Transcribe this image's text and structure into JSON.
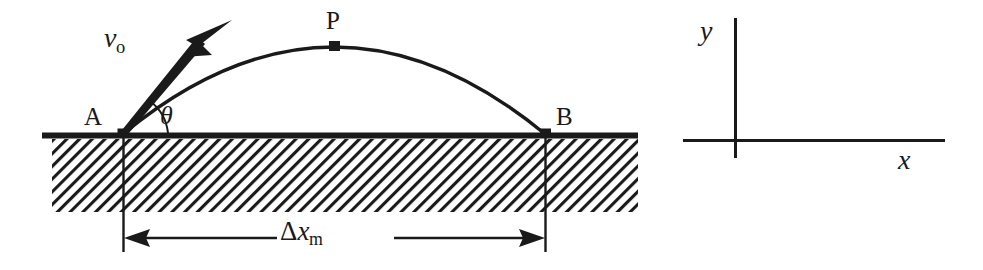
{
  "figure": {
    "stroke_color": "#1a1a1a",
    "background_color": "#ffffff"
  },
  "labels": {
    "point_a": "A",
    "point_b": "B",
    "point_p": "P",
    "angle": "θ",
    "velocity_symbol": "v",
    "velocity_subscript": "o",
    "range_delta": "Δ",
    "range_symbol": "x",
    "range_subscript": "m",
    "axis_y": "y",
    "axis_x": "x"
  },
  "geometry": {
    "ground_line_y": 135,
    "ground_x_start": 42,
    "ground_x_end": 638,
    "launch_point_x": 123,
    "landing_point_x": 545,
    "apex_x": 334,
    "apex_y": 48,
    "hatch_top": 139,
    "hatch_bottom": 212,
    "hatch_x_start": 52,
    "hatch_x_end": 638,
    "dimension_line_y": 238,
    "vector_tip_x": 228,
    "vector_tip_y": 22,
    "launch_angle_degrees": 60,
    "axes_origin_x": 735,
    "axes_origin_y": 140,
    "axis_y_top": 18,
    "axis_y_bottom": 158,
    "axis_x_left": 683,
    "axis_x_right": 945
  }
}
